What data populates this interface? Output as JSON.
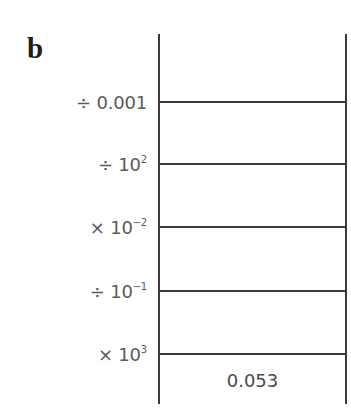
{
  "panel": {
    "label": "b"
  },
  "steps": [
    {
      "op": "÷ 0.001",
      "base": "",
      "exp": "",
      "line_y": 102
    },
    {
      "op": "÷ 10",
      "base": "",
      "exp": "2",
      "line_y": 164
    },
    {
      "op": "× 10",
      "base": "",
      "exp": "−2",
      "line_y": 227
    },
    {
      "op": "÷ 10",
      "base": "",
      "exp": "−1",
      "line_y": 291
    },
    {
      "op": "× 10",
      "base": "",
      "exp": "3",
      "line_y": 354
    }
  ],
  "result": {
    "value": "0.053"
  },
  "colors": {
    "line": "#3a3a3a",
    "text": "#5a5a5a",
    "label": "#1e1e1e"
  }
}
